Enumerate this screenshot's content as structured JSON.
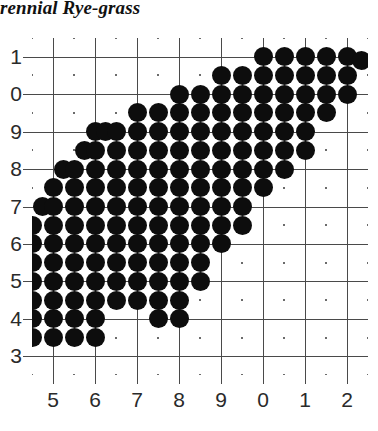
{
  "figure": {
    "title": "rennial Rye-grass",
    "caption": "Variety Comparison by year"
  },
  "axes": {
    "x_tick_labels": [
      "5",
      "6",
      "7",
      "8",
      "9",
      "0",
      "1",
      "2"
    ],
    "y_tick_labels": [
      "1",
      "0",
      "9",
      "8",
      "7",
      "6",
      "5",
      "4",
      "3"
    ]
  },
  "chart_data": {
    "type": "scatter",
    "title": "rennial Rye-grass",
    "xlabel": "",
    "ylabel": "",
    "grid": true,
    "legend": null,
    "marker": "filled-circle",
    "marker_color": "#0d0d0d",
    "grid_color": "#4a4a4a",
    "background": "#ffffff",
    "xlim": [
      4.5,
      12.5
    ],
    "ylim": [
      2.5,
      11.5
    ],
    "x_tick_values": [
      5,
      6,
      7,
      8,
      9,
      10,
      11,
      12
    ],
    "x_tick_labels": [
      "5",
      "6",
      "7",
      "8",
      "9",
      "0",
      "1",
      "2"
    ],
    "y_tick_values": [
      11,
      10,
      9,
      8,
      7,
      6,
      5,
      4,
      3
    ],
    "y_tick_labels": [
      "1",
      "0",
      "9",
      "8",
      "7",
      "6",
      "5",
      "4",
      "3"
    ],
    "note": "Dense lattice of filled circles on a half-unit grid forming a diagonal band from lower-left to upper-right.",
    "lattice_step": 0.5,
    "points": [
      [
        4.5,
        3.5
      ],
      [
        5.0,
        3.5
      ],
      [
        5.5,
        3.5
      ],
      [
        6.0,
        3.5
      ],
      [
        4.5,
        4.0
      ],
      [
        5.0,
        4.0
      ],
      [
        5.5,
        4.0
      ],
      [
        6.0,
        4.0
      ],
      [
        7.5,
        4.0
      ],
      [
        8.0,
        4.0
      ],
      [
        4.5,
        4.5
      ],
      [
        5.0,
        4.5
      ],
      [
        5.5,
        4.5
      ],
      [
        6.0,
        4.5
      ],
      [
        6.5,
        4.5
      ],
      [
        7.0,
        4.5
      ],
      [
        7.5,
        4.5
      ],
      [
        8.0,
        4.5
      ],
      [
        4.5,
        5.0
      ],
      [
        5.0,
        5.0
      ],
      [
        5.5,
        5.0
      ],
      [
        6.0,
        5.0
      ],
      [
        6.5,
        5.0
      ],
      [
        7.0,
        5.0
      ],
      [
        7.5,
        5.0
      ],
      [
        8.0,
        5.0
      ],
      [
        8.5,
        5.0
      ],
      [
        4.5,
        5.5
      ],
      [
        5.0,
        5.5
      ],
      [
        5.5,
        5.5
      ],
      [
        6.0,
        5.5
      ],
      [
        6.5,
        5.5
      ],
      [
        7.0,
        5.5
      ],
      [
        7.5,
        5.5
      ],
      [
        8.0,
        5.5
      ],
      [
        8.5,
        5.5
      ],
      [
        4.5,
        6.0
      ],
      [
        5.0,
        6.0
      ],
      [
        5.5,
        6.0
      ],
      [
        6.0,
        6.0
      ],
      [
        6.5,
        6.0
      ],
      [
        7.0,
        6.0
      ],
      [
        7.5,
        6.0
      ],
      [
        8.0,
        6.0
      ],
      [
        8.5,
        6.0
      ],
      [
        9.0,
        6.0
      ],
      [
        4.5,
        6.5
      ],
      [
        5.0,
        6.5
      ],
      [
        5.5,
        6.5
      ],
      [
        6.0,
        6.5
      ],
      [
        6.5,
        6.5
      ],
      [
        7.0,
        6.5
      ],
      [
        7.5,
        6.5
      ],
      [
        8.0,
        6.5
      ],
      [
        8.5,
        6.5
      ],
      [
        9.0,
        6.5
      ],
      [
        9.5,
        6.5
      ],
      [
        4.75,
        7.0
      ],
      [
        5.0,
        7.0
      ],
      [
        5.5,
        7.0
      ],
      [
        6.0,
        7.0
      ],
      [
        6.5,
        7.0
      ],
      [
        7.0,
        7.0
      ],
      [
        7.5,
        7.0
      ],
      [
        8.0,
        7.0
      ],
      [
        8.5,
        7.0
      ],
      [
        9.0,
        7.0
      ],
      [
        9.5,
        7.0
      ],
      [
        5.0,
        7.5
      ],
      [
        5.5,
        7.5
      ],
      [
        6.0,
        7.5
      ],
      [
        6.5,
        7.5
      ],
      [
        7.0,
        7.5
      ],
      [
        7.5,
        7.5
      ],
      [
        8.0,
        7.5
      ],
      [
        8.5,
        7.5
      ],
      [
        9.0,
        7.5
      ],
      [
        9.5,
        7.5
      ],
      [
        10.0,
        7.5
      ],
      [
        5.25,
        8.0
      ],
      [
        5.5,
        8.0
      ],
      [
        6.0,
        8.0
      ],
      [
        6.5,
        8.0
      ],
      [
        7.0,
        8.0
      ],
      [
        7.5,
        8.0
      ],
      [
        8.0,
        8.0
      ],
      [
        8.5,
        8.0
      ],
      [
        9.0,
        8.0
      ],
      [
        9.5,
        8.0
      ],
      [
        10.0,
        8.0
      ],
      [
        10.5,
        8.0
      ],
      [
        5.75,
        8.5
      ],
      [
        6.0,
        8.5
      ],
      [
        6.5,
        8.5
      ],
      [
        7.0,
        8.5
      ],
      [
        7.5,
        8.5
      ],
      [
        8.0,
        8.5
      ],
      [
        8.5,
        8.5
      ],
      [
        9.0,
        8.5
      ],
      [
        9.5,
        8.5
      ],
      [
        10.0,
        8.5
      ],
      [
        10.5,
        8.5
      ],
      [
        11.0,
        8.5
      ],
      [
        6.0,
        9.0
      ],
      [
        6.25,
        9.0
      ],
      [
        6.5,
        9.0
      ],
      [
        7.0,
        9.0
      ],
      [
        7.5,
        9.0
      ],
      [
        8.0,
        9.0
      ],
      [
        8.5,
        9.0
      ],
      [
        9.0,
        9.0
      ],
      [
        9.5,
        9.0
      ],
      [
        10.0,
        9.0
      ],
      [
        10.5,
        9.0
      ],
      [
        11.0,
        9.0
      ],
      [
        7.0,
        9.5
      ],
      [
        7.5,
        9.5
      ],
      [
        8.0,
        9.5
      ],
      [
        8.5,
        9.5
      ],
      [
        9.0,
        9.5
      ],
      [
        9.5,
        9.5
      ],
      [
        10.0,
        9.5
      ],
      [
        10.5,
        9.5
      ],
      [
        11.0,
        9.5
      ],
      [
        11.5,
        9.5
      ],
      [
        8.0,
        10.0
      ],
      [
        8.5,
        10.0
      ],
      [
        9.0,
        10.0
      ],
      [
        9.5,
        10.0
      ],
      [
        10.0,
        10.0
      ],
      [
        10.5,
        10.0
      ],
      [
        11.0,
        10.0
      ],
      [
        11.5,
        10.0
      ],
      [
        12.0,
        10.0
      ],
      [
        9.0,
        10.5
      ],
      [
        9.5,
        10.5
      ],
      [
        10.0,
        10.5
      ],
      [
        10.5,
        10.5
      ],
      [
        11.0,
        10.5
      ],
      [
        11.5,
        10.5
      ],
      [
        12.0,
        10.5
      ],
      [
        10.0,
        11.0
      ],
      [
        10.5,
        11.0
      ],
      [
        11.0,
        11.0
      ],
      [
        11.5,
        11.0
      ],
      [
        12.0,
        11.0
      ],
      [
        12.35,
        10.9
      ]
    ]
  }
}
